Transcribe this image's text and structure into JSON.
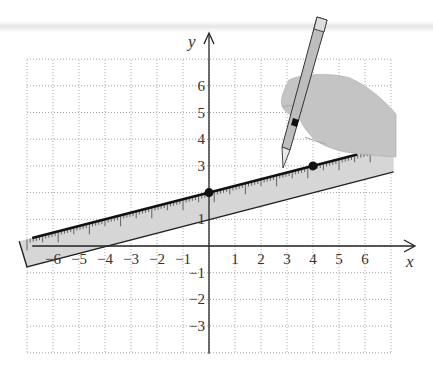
{
  "figure": {
    "x_axis_label": "x",
    "y_axis_label": "y",
    "x_tick_labels": [
      "−6",
      "−5",
      "−4",
      "−3",
      "−2",
      "−1",
      "1",
      "2",
      "3",
      "4",
      "5",
      "6"
    ],
    "x_tick_values": [
      -6,
      -5,
      -4,
      -3,
      -2,
      -1,
      1,
      2,
      3,
      4,
      5,
      6
    ],
    "y_tick_labels": [
      "6",
      "5",
      "4",
      "3",
      "1",
      "−1",
      "−2",
      "−3"
    ],
    "y_tick_values": [
      6,
      5,
      4,
      3,
      1,
      -1,
      -2,
      -3
    ],
    "grid": {
      "xmin": -7,
      "xmax": 7,
      "ymin": -4,
      "ymax": 7,
      "style": "dotted"
    },
    "points": [
      {
        "x": 0,
        "y": 2,
        "label": "(0, 2)"
      },
      {
        "x": 4,
        "y": 3,
        "label": "(4, 3)"
      }
    ],
    "line": {
      "slope": 0.25,
      "intercept": 2,
      "x_from": -6.8,
      "x_to": 5.7
    },
    "ruler": {
      "top_intercept": 2,
      "bottom_intercept": 1,
      "slope": 0.25,
      "x_left": -7.3,
      "x_right": 7.1,
      "fill": "#d6d6d6"
    },
    "hand_fill": "#c4c4c4",
    "pencil_fill": "#bdbdbd"
  }
}
